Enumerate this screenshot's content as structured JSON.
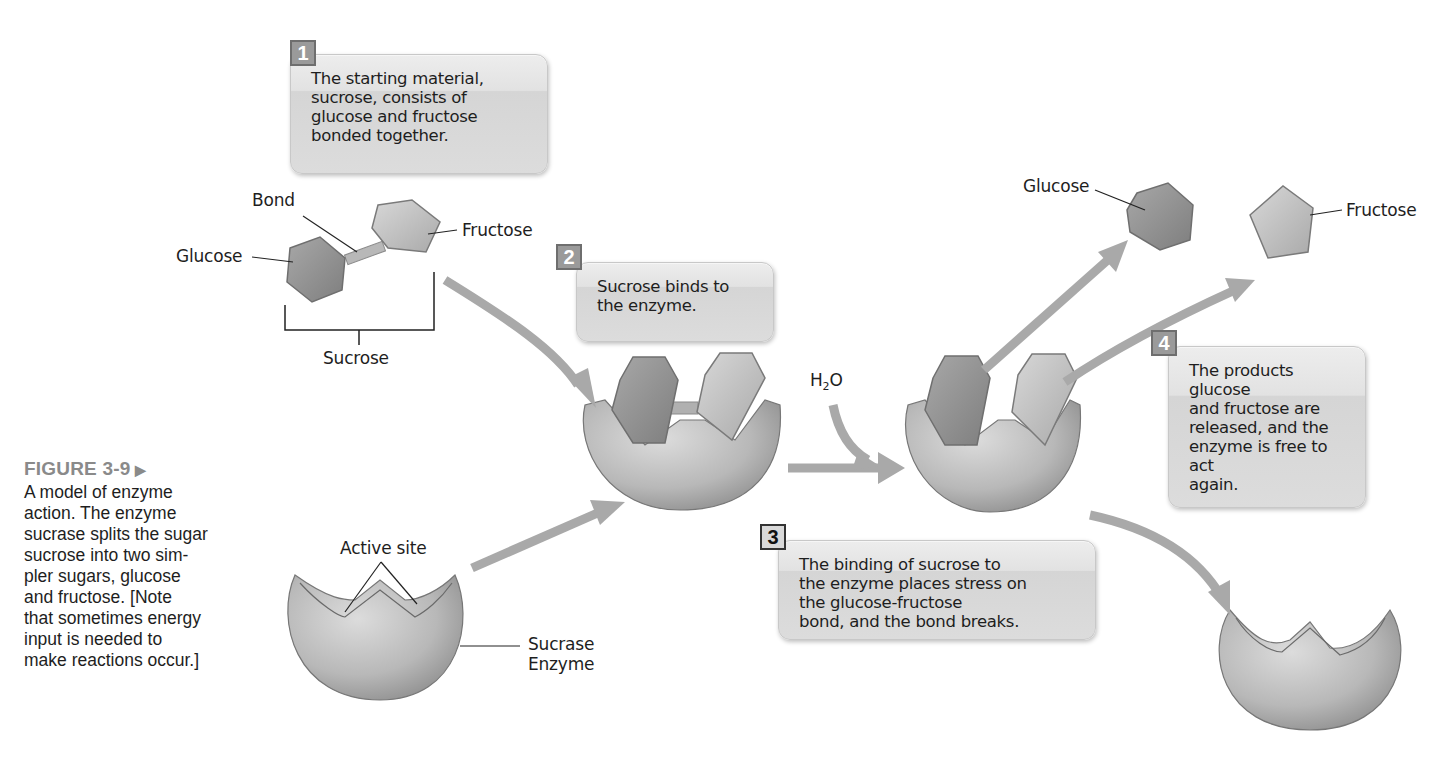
{
  "figure": {
    "number_label": "FIGURE 3-9",
    "arrow_glyph": "▶",
    "caption": "A model of enzyme\naction. The enzyme\nsucrase splits the sugar\nsucrose into two sim-\npler sugars, glucose\nand fructose. [Note\nthat sometimes energy\ninput is needed to\nmake reactions occur.]"
  },
  "steps": [
    {
      "number": "1",
      "text": "The starting material,\nsucrose, consists of\nglucose and fructose\nbonded together."
    },
    {
      "number": "2",
      "text": "Sucrose binds to\nthe enzyme."
    },
    {
      "number": "3",
      "text": "The binding of sucrose to\nthe enzyme places stress on\nthe glucose-fructose\nbond, and the bond breaks."
    },
    {
      "number": "4",
      "text": "The products glucose\nand fructose are\nreleased, and the\nenzyme is free to act\nagain."
    }
  ],
  "labels": {
    "bond": "Bond",
    "glucose": "Glucose",
    "fructose": "Fructose",
    "sucrose": "Sucrose",
    "active_site": "Active site",
    "enzyme_line1": "Sucrase",
    "enzyme_line2": "Enzyme",
    "water": "H",
    "water_sub": "2",
    "water_o": "O",
    "product_glucose": "Glucose",
    "product_fructose": "Fructose"
  },
  "colors": {
    "arrow": "#a9a9a9",
    "enzyme": "#b4b4b4",
    "glucose": "#8f8f8f",
    "fructose": "#c4c4c4",
    "badge": "#9a9a9a"
  }
}
